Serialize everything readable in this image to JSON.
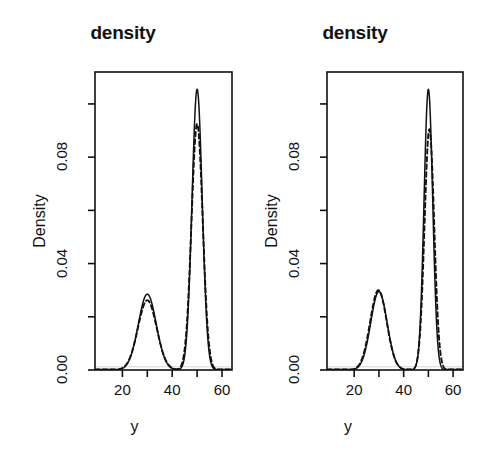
{
  "figure": {
    "width": 493,
    "height": 465,
    "background": "#ffffff",
    "line_color": "#111111"
  },
  "chart_data": [
    {
      "type": "line",
      "panel": "left",
      "title": "density",
      "xlabel": "y",
      "ylabel": "Density",
      "xlim": [
        9,
        64
      ],
      "ylim": [
        0,
        0.112
      ],
      "grid": false,
      "legend": "none",
      "x_ticks_major": [
        20,
        40,
        60
      ],
      "x_ticks_minor": [
        30,
        50
      ],
      "x_tick_labels": [
        "20",
        "40",
        "60"
      ],
      "y_ticks_major": [
        0.0,
        0.04,
        0.08
      ],
      "y_ticks_minor": [
        0.02,
        0.06,
        0.1
      ],
      "y_tick_labels": [
        "0.00",
        "0.04",
        "0.08"
      ],
      "series": [
        {
          "name": "solid",
          "style": "solid",
          "color": "#111111",
          "peaks": [
            {
              "center": 30.0,
              "height": 0.0285,
              "width": 3.6
            },
            {
              "center": 50.0,
              "height": 0.1055,
              "width": 2.05
            }
          ],
          "x": [
            9,
            11,
            13,
            15,
            17,
            19,
            21,
            22,
            23,
            24,
            25,
            26,
            27,
            28,
            29,
            30,
            31,
            32,
            33,
            34,
            35,
            36,
            37,
            38,
            39,
            40,
            41,
            42,
            43,
            44,
            45,
            46,
            47,
            48,
            49,
            50,
            51,
            52,
            53,
            54,
            55,
            56,
            57,
            58,
            59,
            60,
            61,
            62,
            63,
            64
          ],
          "y": [
            0.0004,
            0.0009,
            0.0018,
            0.0034,
            0.0063,
            0.0107,
            0.0168,
            0.0201,
            0.0232,
            0.0257,
            0.0274,
            0.0283,
            0.0285,
            0.0283,
            0.0283,
            0.0285,
            0.0281,
            0.0267,
            0.0242,
            0.0208,
            0.0168,
            0.0127,
            0.0089,
            0.0058,
            0.0036,
            0.0022,
            0.0016,
            0.0018,
            0.0034,
            0.0079,
            0.0175,
            0.0336,
            0.0563,
            0.0809,
            0.0995,
            0.1055,
            0.0994,
            0.0808,
            0.0562,
            0.0335,
            0.0174,
            0.0079,
            0.0032,
            0.0013,
            0.0006,
            0.0003,
            0.0002,
            0.0002,
            0.0002,
            0.0002
          ]
        },
        {
          "name": "dashed",
          "style": "dashed",
          "color": "#111111",
          "peaks": [
            {
              "center": 30.0,
              "height": 0.0262,
              "width": 3.75
            },
            {
              "center": 50.0,
              "height": 0.0925,
              "width": 2.25
            }
          ],
          "x": [
            9,
            11,
            13,
            15,
            17,
            19,
            21,
            22,
            23,
            24,
            25,
            26,
            27,
            28,
            29,
            30,
            31,
            32,
            33,
            34,
            35,
            36,
            37,
            38,
            39,
            40,
            41,
            42,
            43,
            44,
            45,
            46,
            47,
            48,
            49,
            50,
            51,
            52,
            53,
            54,
            55,
            56,
            57,
            58,
            59,
            60,
            61,
            62,
            63,
            64
          ],
          "y": [
            0.0005,
            0.0011,
            0.0022,
            0.0041,
            0.0072,
            0.0116,
            0.0171,
            0.0199,
            0.0225,
            0.0245,
            0.0258,
            0.0262,
            0.0261,
            0.0257,
            0.0257,
            0.0262,
            0.0261,
            0.0251,
            0.0231,
            0.0202,
            0.0167,
            0.013,
            0.0094,
            0.0064,
            0.0041,
            0.0026,
            0.0019,
            0.0022,
            0.0039,
            0.0085,
            0.018,
            0.033,
            0.053,
            0.074,
            0.0885,
            0.0925,
            0.0884,
            0.0739,
            0.0529,
            0.0329,
            0.0179,
            0.0085,
            0.0037,
            0.0016,
            0.0007,
            0.0004,
            0.0002,
            0.0002,
            0.0002,
            0.0002
          ]
        }
      ]
    },
    {
      "type": "line",
      "panel": "right",
      "title": "density",
      "xlabel": "y",
      "ylabel": "Density",
      "xlim": [
        9,
        64
      ],
      "ylim": [
        0,
        0.112
      ],
      "grid": false,
      "legend": "none",
      "x_ticks_major": [
        20,
        40,
        60
      ],
      "x_ticks_minor": [
        30,
        50
      ],
      "x_tick_labels": [
        "20",
        "40",
        "60"
      ],
      "y_ticks_major": [
        0.0,
        0.04,
        0.08
      ],
      "y_ticks_minor": [
        0.02,
        0.06,
        0.1
      ],
      "y_tick_labels": [
        "0.00",
        "0.04",
        "0.08"
      ],
      "series": [
        {
          "name": "solid",
          "style": "solid",
          "color": "#111111",
          "peaks": [
            {
              "center": 30.0,
              "height": 0.0295,
              "width": 3.3
            },
            {
              "center": 50.0,
              "height": 0.1055,
              "width": 1.75
            }
          ],
          "x": [
            9,
            11,
            13,
            15,
            17,
            19,
            21,
            22,
            23,
            24,
            25,
            26,
            27,
            28,
            29,
            30,
            31,
            32,
            33,
            34,
            35,
            36,
            37,
            38,
            39,
            40,
            41,
            42,
            43,
            44,
            45,
            46,
            47,
            48,
            49,
            50,
            51,
            52,
            53,
            54,
            55,
            56,
            57,
            58,
            59,
            60,
            61,
            62,
            63,
            64
          ],
          "y": [
            0.0002,
            0.0005,
            0.0011,
            0.0023,
            0.0047,
            0.0089,
            0.0155,
            0.0195,
            0.0234,
            0.0266,
            0.0287,
            0.0295,
            0.0293,
            0.0288,
            0.0289,
            0.0295,
            0.0291,
            0.0273,
            0.024,
            0.0197,
            0.0149,
            0.0104,
            0.0066,
            0.0038,
            0.002,
            0.001,
            0.0006,
            0.0006,
            0.0014,
            0.0044,
            0.0124,
            0.0292,
            0.0563,
            0.0858,
            0.1035,
            0.1055,
            0.1033,
            0.0855,
            0.056,
            0.029,
            0.0123,
            0.0044,
            0.0014,
            0.0005,
            0.0002,
            0.0002,
            0.0002,
            0.0002,
            0.0002,
            0.0002
          ]
        },
        {
          "name": "dashed",
          "style": "dashed",
          "color": "#111111",
          "peaks": [
            {
              "center": 50.4,
              "height": 0.0905,
              "width": 1.95
            },
            {
              "center": 29.8,
              "height": 0.03,
              "width": 3.35
            }
          ],
          "x": [
            9,
            11,
            13,
            15,
            17,
            19,
            21,
            22,
            23,
            24,
            25,
            26,
            27,
            28,
            29,
            30,
            31,
            32,
            33,
            34,
            35,
            36,
            37,
            38,
            39,
            40,
            41,
            42,
            43,
            44,
            45,
            46,
            47,
            48,
            49,
            50,
            51,
            52,
            53,
            54,
            55,
            56,
            57,
            58,
            59,
            60,
            61,
            62,
            63,
            64
          ],
          "y": [
            0.0002,
            0.0006,
            0.0013,
            0.0027,
            0.0053,
            0.0098,
            0.0166,
            0.0207,
            0.0245,
            0.0276,
            0.0295,
            0.03,
            0.0296,
            0.029,
            0.0292,
            0.0299,
            0.0294,
            0.0275,
            0.0241,
            0.0197,
            0.0148,
            0.0103,
            0.0065,
            0.0037,
            0.0019,
            0.0009,
            0.0005,
            0.0004,
            0.0005,
            0.0012,
            0.0044,
            0.014,
            0.0342,
            0.063,
            0.0845,
            0.09,
            0.0878,
            0.0722,
            0.046,
            0.0226,
            0.0088,
            0.0029,
            0.0009,
            0.0003,
            0.0002,
            0.0002,
            0.0002,
            0.0002,
            0.0002,
            0.0002
          ]
        }
      ]
    }
  ]
}
